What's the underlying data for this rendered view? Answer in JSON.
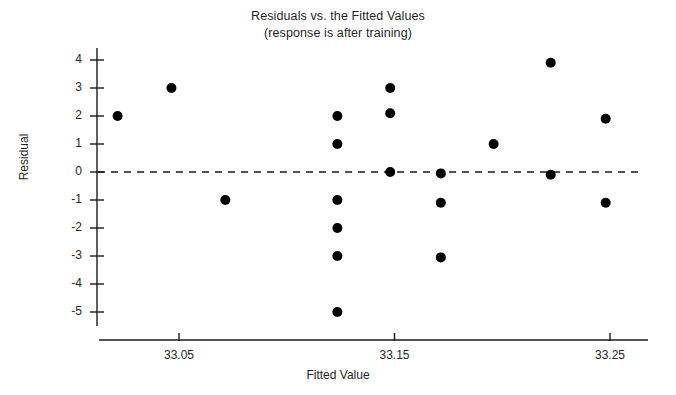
{
  "chart_data": {
    "type": "scatter",
    "title": "Residuals vs. the Fitted Values",
    "subtitle": "(response is after training)",
    "xlabel": "Fitted Value",
    "ylabel": "Residual",
    "xlim": [
      33.005,
      33.263
    ],
    "ylim": [
      -5.45,
      4.35
    ],
    "xticks": [
      33.05,
      33.15,
      33.25
    ],
    "xtick_labels": [
      "33.05",
      "33.15",
      "33.25"
    ],
    "yticks": [
      4,
      3,
      2,
      1,
      0,
      -1,
      -2,
      -3,
      -4,
      -5
    ],
    "ytick_labels": [
      "4",
      "3",
      "2",
      "1",
      "0",
      "-1",
      "-2",
      "-3",
      "-4",
      "-5"
    ],
    "grid": false,
    "legend": false,
    "reference_line": {
      "orientation": "horizontal",
      "y": 0,
      "style": "dashed",
      "color": "#000000"
    },
    "marker": {
      "shape": "circle",
      "color": "#000000",
      "size": 5
    },
    "points": [
      {
        "x": 33.0215,
        "y": 2.0
      },
      {
        "x": 33.0465,
        "y": 3.0
      },
      {
        "x": 33.0715,
        "y": -1.0
      },
      {
        "x": 33.1235,
        "y": 2.0
      },
      {
        "x": 33.1235,
        "y": 1.0
      },
      {
        "x": 33.1235,
        "y": -1.0
      },
      {
        "x": 33.1235,
        "y": -2.0
      },
      {
        "x": 33.1235,
        "y": -3.0
      },
      {
        "x": 33.1235,
        "y": -5.0
      },
      {
        "x": 33.148,
        "y": 3.0
      },
      {
        "x": 33.148,
        "y": 2.1
      },
      {
        "x": 33.148,
        "y": 0.0
      },
      {
        "x": 33.1715,
        "y": -0.05
      },
      {
        "x": 33.1715,
        "y": -1.1
      },
      {
        "x": 33.1715,
        "y": -3.05
      },
      {
        "x": 33.196,
        "y": 1.0
      },
      {
        "x": 33.2225,
        "y": 3.9
      },
      {
        "x": 33.2225,
        "y": -0.1
      },
      {
        "x": 33.248,
        "y": 1.9
      },
      {
        "x": 33.248,
        "y": -1.1
      }
    ]
  }
}
